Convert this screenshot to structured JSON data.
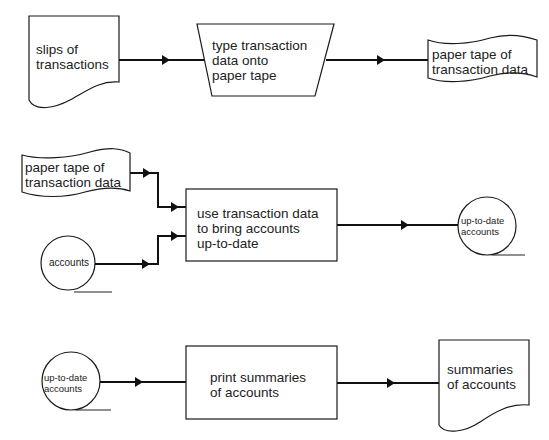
{
  "diagram": {
    "type": "flowchart",
    "flows": [
      {
        "id": "flow1",
        "nodes": [
          {
            "shape": "document",
            "label": [
              "slips of",
              "transactions"
            ]
          },
          {
            "shape": "manual-operation",
            "label": [
              "type transaction",
              "data onto",
              "paper tape"
            ]
          },
          {
            "shape": "punched-tape",
            "label": [
              "paper tape of",
              "transaction data"
            ]
          }
        ]
      },
      {
        "id": "flow2",
        "nodes": [
          {
            "shape": "punched-tape",
            "label": [
              "paper tape of",
              "transaction data"
            ]
          },
          {
            "shape": "magnetic-tape",
            "label": [
              "accounts"
            ]
          },
          {
            "shape": "process",
            "label": [
              "use transaction data",
              "to bring accounts",
              "up-to-date"
            ]
          },
          {
            "shape": "magnetic-tape",
            "label": [
              "up-to-date",
              "accounts"
            ]
          }
        ]
      },
      {
        "id": "flow3",
        "nodes": [
          {
            "shape": "magnetic-tape",
            "label": [
              "up-to-date",
              "accounts"
            ]
          },
          {
            "shape": "process",
            "label": [
              "print summaries",
              "of accounts"
            ]
          },
          {
            "shape": "document",
            "label": [
              "summaries",
              "of accounts"
            ]
          }
        ]
      }
    ]
  },
  "f1": {
    "slips": {
      "l1": "slips of",
      "l2": "transactions"
    },
    "type": {
      "l1": "type transaction",
      "l2": "data onto",
      "l3": "paper tape"
    },
    "tape": {
      "l1": "paper tape of",
      "l2": "transaction data"
    }
  },
  "f2": {
    "tape": {
      "l1": "paper tape of",
      "l2": "transaction data"
    },
    "accounts": {
      "l1": "accounts"
    },
    "process": {
      "l1": "use transaction data",
      "l2": "to bring accounts",
      "l3": "up-to-date"
    },
    "out": {
      "l1": "up-to-date",
      "l2": "accounts"
    }
  },
  "f3": {
    "in": {
      "l1": "up-to-date",
      "l2": "accounts"
    },
    "process": {
      "l1": "print summaries",
      "l2": "of accounts"
    },
    "doc": {
      "l1": "summaries",
      "l2": "of accounts"
    }
  }
}
